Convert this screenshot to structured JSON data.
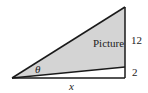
{
  "diagram": {
    "labels": {
      "region": "Picture",
      "upper_length": "12",
      "lower_length": "2",
      "angle": "θ",
      "base": "x"
    },
    "colors": {
      "fill": "#d4d4d4",
      "stroke": "#1a1a1a"
    }
  }
}
